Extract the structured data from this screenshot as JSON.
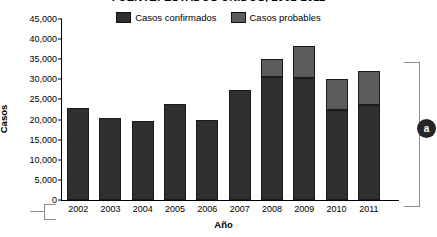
{
  "chart_data": {
    "type": "bar",
    "stacked": true,
    "title": "FUENTE: ESTADOS UNIDOS, 2002-2011",
    "xlabel": "Año",
    "ylabel": "Casos",
    "categories": [
      "2002",
      "2003",
      "2004",
      "2005",
      "2006",
      "2007",
      "2008",
      "2009",
      "2010",
      "2011"
    ],
    "ylim": [
      0,
      45000
    ],
    "ytick_step": 5000,
    "yticks": [
      "0",
      "5,000",
      "10,000",
      "15,000",
      "20,000",
      "25,000",
      "30,000",
      "35,000",
      "40,000",
      "45,000"
    ],
    "ytick_values": [
      0,
      5000,
      10000,
      15000,
      20000,
      25000,
      30000,
      35000,
      40000,
      45000
    ],
    "grid": false,
    "legend_position": "top-center",
    "series": [
      {
        "name": "Casos confirmados",
        "color": "#2f2f2f",
        "values": [
          23000,
          20500,
          19700,
          23800,
          19800,
          27400,
          30500,
          30400,
          22400,
          23700
        ]
      },
      {
        "name": "Casos probables",
        "color": "#5c5c5c",
        "values": [
          0,
          0,
          0,
          0,
          0,
          0,
          4500,
          7900,
          7600,
          8500
        ]
      }
    ],
    "totals": [
      23000,
      20500,
      19700,
      23800,
      19800,
      27400,
      35000,
      38300,
      30000,
      32200
    ]
  },
  "annotations": {
    "right_badge_label": "a"
  }
}
